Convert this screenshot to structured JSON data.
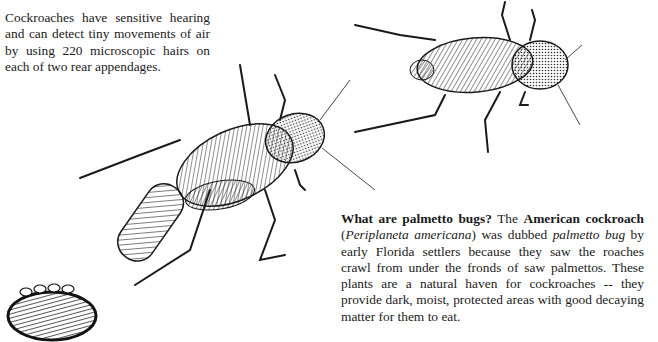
{
  "hearing_note": {
    "text": "Cockroaches have sensitive hearing and can detect tiny movements of air by using 220 microscopic hairs on each of two rear appendages."
  },
  "palmetto_note": {
    "heading": "What are palmetto bugs?",
    "intro": " The ",
    "common_name": "American cockroach",
    "open_paren": " (",
    "scientific_name": "Periplaneta americana",
    "close_dubbed": ") was dubbed ",
    "nickname": "palmetto bug",
    "rest": " by early Florida settlers because they saw the roaches crawl from under the fronds of saw palmettos. These plants are a natural haven for cockroaches -- they provide dark, moist, protected areas with good decaying matter for them to eat."
  },
  "illustrations": [
    {
      "name": "female-cockroach-with-egg-case",
      "description": "Large cockroach dragging an egg case"
    },
    {
      "name": "adult-cockroach",
      "description": "Adult cockroach, top right"
    },
    {
      "name": "egg-case",
      "description": "Egg case (ootheca), bottom left"
    }
  ],
  "colors": {
    "ink": "#1a1a1a",
    "paper": "#ffffff"
  }
}
